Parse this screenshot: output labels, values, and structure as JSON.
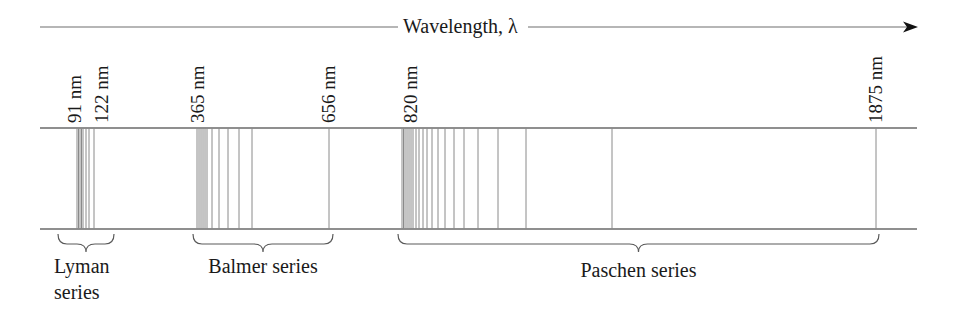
{
  "figure": {
    "axis_title": "Wavelength, λ",
    "axis_direction_icon": "arrow-right-icon",
    "colors": {
      "ink": "#1a1a1a",
      "lines": "#6e6e6e",
      "background": "#ffffff"
    }
  },
  "wavelength_labels": [
    {
      "text": "91 nm",
      "x": 74
    },
    {
      "text": "122 nm",
      "x": 101
    },
    {
      "text": "365 nm",
      "x": 197
    },
    {
      "text": "656 nm",
      "x": 328
    },
    {
      "text": "820 nm",
      "x": 410
    },
    {
      "text": "1875 nm",
      "x": 875
    }
  ],
  "series": [
    {
      "name": "Lyman",
      "label_lines": [
        "Lyman",
        "series"
      ],
      "limit_nm": 91,
      "first_line_nm": 122,
      "line_x": [
        77,
        78.5,
        80,
        81.5,
        83,
        86,
        89,
        94
      ],
      "brace": {
        "x1": 58,
        "x2": 114
      }
    },
    {
      "name": "Balmer",
      "label_lines": [
        "Balmer series"
      ],
      "limit_nm": 365,
      "first_line_nm": 656,
      "line_x": [
        197,
        199,
        201,
        203,
        205,
        207,
        212,
        219,
        228,
        239,
        252,
        329
      ],
      "brace": {
        "x1": 193,
        "x2": 333
      }
    },
    {
      "name": "Paschen",
      "label_lines": [
        "Paschen series"
      ],
      "limit_nm": 820,
      "first_line_nm": 1875,
      "line_x": [
        402,
        403.5,
        405,
        407,
        409,
        411,
        413,
        416,
        419,
        423,
        427,
        432,
        438,
        445,
        454,
        464,
        478,
        498,
        526,
        612,
        876
      ],
      "brace": {
        "x1": 398,
        "x2": 879
      }
    }
  ]
}
